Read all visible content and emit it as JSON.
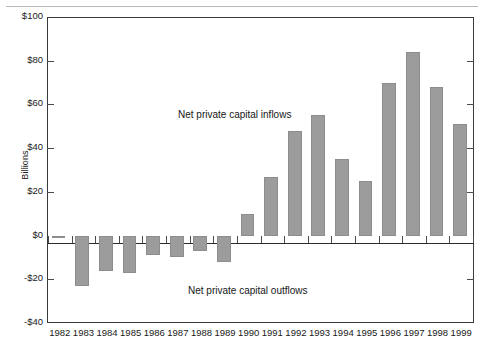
{
  "chart_data": {
    "type": "bar",
    "title": "",
    "subtitle": "",
    "xlabel": "",
    "ylabel": "Billions",
    "categories": [
      "1982",
      "1983",
      "1984",
      "1985",
      "1986",
      "1987",
      "1988",
      "1989",
      "1990",
      "1991",
      "1992",
      "1993",
      "1994",
      "1995",
      "1996",
      "1997",
      "1998",
      "1999"
    ],
    "values": [
      -1,
      -23,
      -16,
      -17,
      -9,
      -10,
      -7,
      -12,
      10,
      27,
      48,
      55,
      35,
      25,
      70,
      84,
      68,
      51
    ],
    "series": [
      {
        "name": "Net private capital flows",
        "values": [
          -1,
          -23,
          -16,
          -17,
          -9,
          -10,
          -7,
          -12,
          10,
          27,
          48,
          55,
          35,
          25,
          70,
          84,
          68,
          51
        ]
      }
    ],
    "ylim": [
      -40,
      100
    ],
    "ytick_values": [
      100,
      80,
      60,
      40,
      20,
      0,
      -20,
      -40
    ],
    "ytick_labels": [
      "$100",
      "$80",
      "$60",
      "$40",
      "$20",
      "$0",
      "-$20",
      "-$40"
    ],
    "grid": false,
    "legend": "none",
    "annotations": [
      {
        "text": "Net private capital inflows",
        "region": "above-zero"
      },
      {
        "text": "Net private capital outflows",
        "region": "below-zero"
      }
    ],
    "colors": {
      "bar_fill": "#9c9c9c",
      "bar_edge": "#8d8d8d",
      "axis": "#3a3a3a",
      "zero_line": "#2b2b2b",
      "text": "#1a1a1a"
    }
  }
}
